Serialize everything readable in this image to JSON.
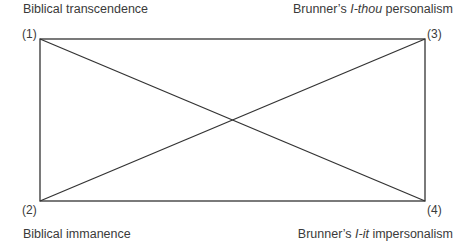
{
  "labels": {
    "top_left": "Biblical transcendence",
    "top_right": {
      "prefix": "Brunner’s ",
      "italic": "I-thou",
      "suffix": " personalism"
    },
    "bottom_left": "Biblical immanence",
    "bottom_right": {
      "prefix": "Brunner’s ",
      "italic": "I-it",
      "suffix": " impersonalism"
    }
  },
  "corners": {
    "c1": "(1)",
    "c2": "(2)",
    "c3": "(3)",
    "c4": "(4)"
  },
  "colors": {
    "line": "#333333",
    "text": "#3a3a3a"
  }
}
